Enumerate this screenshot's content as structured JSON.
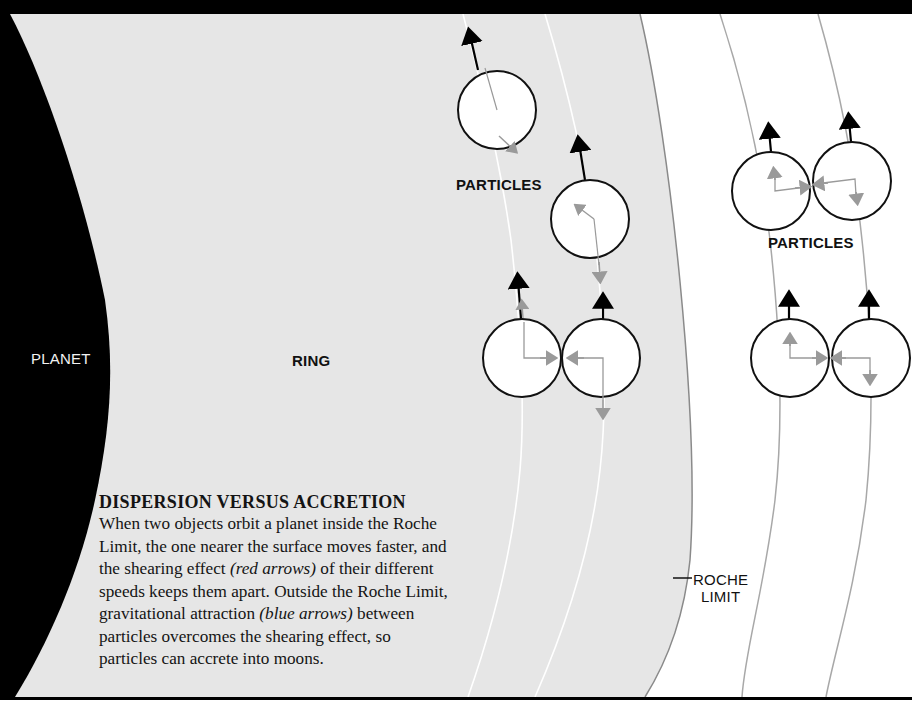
{
  "figure": {
    "title": "DISPERSION VERSUS ACCRETION",
    "caption_parts": [
      {
        "text": "When two objects orbit a planet inside the Roche Limit, the one nearer the surface moves faster, and the shearing effect ",
        "italic": false
      },
      {
        "text": "(red arrows)",
        "italic": true
      },
      {
        "text": " of their different speeds keeps them apart. Outside the Roche Limit, gravitational attraction ",
        "italic": false
      },
      {
        "text": "(blue arrows)",
        "italic": true
      },
      {
        "text": " between particles overcomes the shearing effect, so particles can accrete into moons.",
        "italic": false
      }
    ]
  },
  "labels": {
    "planet": "PLANET",
    "ring": "RING",
    "particles_inside": "PARTICLES",
    "particles_outside": "PARTICLES",
    "roche_line1": "ROCHE",
    "roche_line2": "LIMIT"
  },
  "colors": {
    "planet": "#000000",
    "ring": "#e6e6e6",
    "space": "#ffffff",
    "frame": "#000000",
    "orbit_inside": "#ffffff",
    "orbit_outside": "#a8a8a8",
    "velocity_arrow": "#000000",
    "force_arrow": "#9a9a9a",
    "particle_fill": "#ffffff",
    "particle_stroke": "#111111"
  },
  "regions": [
    {
      "name": "planet",
      "description": "black curved body at left"
    },
    {
      "name": "ring",
      "description": "grey band inside Roche Limit"
    },
    {
      "name": "outside-roche",
      "description": "white region beyond Roche Limit"
    }
  ],
  "particles": [
    {
      "id": "inside-top-1",
      "region": "ring",
      "cx": 497,
      "cy": 110,
      "r": 39
    },
    {
      "id": "inside-top-2",
      "region": "ring",
      "cx": 590,
      "cy": 219,
      "r": 39
    },
    {
      "id": "inside-pair-left",
      "region": "ring",
      "cx": 522,
      "cy": 358,
      "r": 39
    },
    {
      "id": "inside-pair-right",
      "region": "ring",
      "cx": 601,
      "cy": 358,
      "r": 39
    },
    {
      "id": "outside-top-left",
      "region": "outside-roche",
      "cx": 771,
      "cy": 191,
      "r": 39
    },
    {
      "id": "outside-top-right",
      "region": "outside-roche",
      "cx": 852,
      "cy": 181,
      "r": 39
    },
    {
      "id": "outside-pair-left",
      "region": "outside-roche",
      "cx": 790,
      "cy": 358,
      "r": 39
    },
    {
      "id": "outside-pair-right",
      "region": "outside-roche",
      "cx": 871,
      "cy": 358,
      "r": 39
    }
  ]
}
